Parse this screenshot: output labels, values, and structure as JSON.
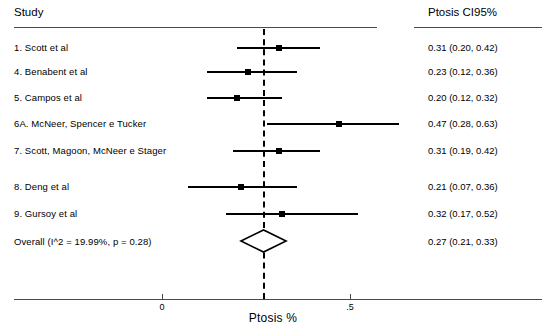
{
  "header": {
    "study_label": "Study",
    "effect_label": "Ptosis CI95%"
  },
  "axis": {
    "title": "Ptosis %",
    "ticks": [
      {
        "label": "0",
        "value": 0
      },
      {
        "label": ".5",
        "value": 0.5
      }
    ]
  },
  "overall": {
    "label": "Overall  (I^2 = 19.99%, p = 0.28)",
    "value_text": "0.27 (0.21, 0.33)"
  },
  "chart_data": {
    "type": "forest",
    "title": "",
    "xlabel": "Ptosis %",
    "ylabel": "Study",
    "xlim": [
      -0.07,
      0.93
    ],
    "grid": false,
    "reference_line": 0.27,
    "effect_column_header": "Ptosis CI95%",
    "study_column_header": "Study",
    "studies": [
      {
        "label": "1. Scott et al",
        "value_text": "0.31 (0.20, 0.42)",
        "estimate": 0.31,
        "ci_low": 0.2,
        "ci_high": 0.42
      },
      {
        "label": "4. Benabent et al",
        "value_text": "0.23 (0.12, 0.36)",
        "estimate": 0.23,
        "ci_low": 0.12,
        "ci_high": 0.36
      },
      {
        "label": "5. Campos et al",
        "value_text": "0.20 (0.12, 0.32)",
        "estimate": 0.2,
        "ci_low": 0.12,
        "ci_high": 0.32
      },
      {
        "label": "6A. McNeer, Spencer e Tucker",
        "value_text": "0.47 (0.28, 0.63)",
        "estimate": 0.47,
        "ci_low": 0.28,
        "ci_high": 0.63
      },
      {
        "label": "7. Scott, Magoon, McNeer e Stager",
        "value_text": "0.31 (0.19, 0.42)",
        "estimate": 0.31,
        "ci_low": 0.19,
        "ci_high": 0.42
      },
      {
        "label": "8. Deng et al",
        "value_text": "0.21 (0.07, 0.36)",
        "estimate": 0.21,
        "ci_low": 0.07,
        "ci_high": 0.36
      },
      {
        "label": "9. Gursoy et al",
        "value_text": "0.32 (0.17, 0.52)",
        "estimate": 0.32,
        "ci_low": 0.17,
        "ci_high": 0.52
      }
    ],
    "summary": {
      "label": "Overall  (I^2 = 19.99%, p = 0.28)",
      "value_text": "0.27 (0.21, 0.33)",
      "estimate": 0.27,
      "ci_low": 0.21,
      "ci_high": 0.33,
      "heterogeneity_i2": 19.99,
      "p_value": 0.28
    }
  }
}
